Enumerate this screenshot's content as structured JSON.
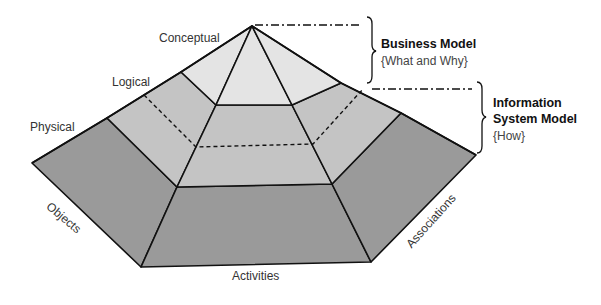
{
  "diagram": {
    "type": "layered pyramid",
    "tiers": [
      {
        "label": "Conceptual",
        "color": "#e4e4e4"
      },
      {
        "label": "Logical",
        "color": "#c4c4c4"
      },
      {
        "label": "Physical",
        "color": "#9a9a9a"
      }
    ],
    "faces": [
      {
        "label": "Objects"
      },
      {
        "label": "Activities"
      },
      {
        "label": "Associations"
      }
    ],
    "brackets": [
      {
        "title": "Business Model",
        "subtitle": "{What and Why}"
      },
      {
        "title_line1": "Information",
        "title_line2": "System Model",
        "subtitle": "{How}"
      }
    ]
  },
  "colors": {
    "conceptual": "#e4e4e4",
    "logical": "#c4c4c4",
    "physical": "#9a9a9a",
    "stroke": "#111111"
  }
}
